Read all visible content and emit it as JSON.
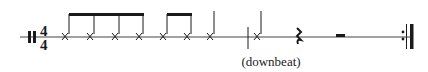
{
  "notation": {
    "time_signature": {
      "top": "4",
      "bottom": "4"
    },
    "annotation": "(downbeat)",
    "colors": {
      "ink": "#1a1a1a",
      "staff": "#444444"
    },
    "notes": [
      {
        "type": "x-notehead",
        "beam_group": 1
      },
      {
        "type": "x-notehead",
        "beam_group": 1
      },
      {
        "type": "x-notehead",
        "beam_group": 1
      },
      {
        "type": "x-notehead",
        "beam_group": 1
      },
      {
        "type": "x-notehead",
        "beam_group": 2
      },
      {
        "type": "x-notehead",
        "beam_group": 2
      },
      {
        "type": "x-notehead",
        "beam_group": null
      },
      {
        "type": "barline"
      },
      {
        "type": "x-notehead",
        "beam_group": null
      },
      {
        "type": "quarter-rest"
      },
      {
        "type": "half-rest"
      },
      {
        "type": "end-repeat-barline"
      }
    ]
  }
}
